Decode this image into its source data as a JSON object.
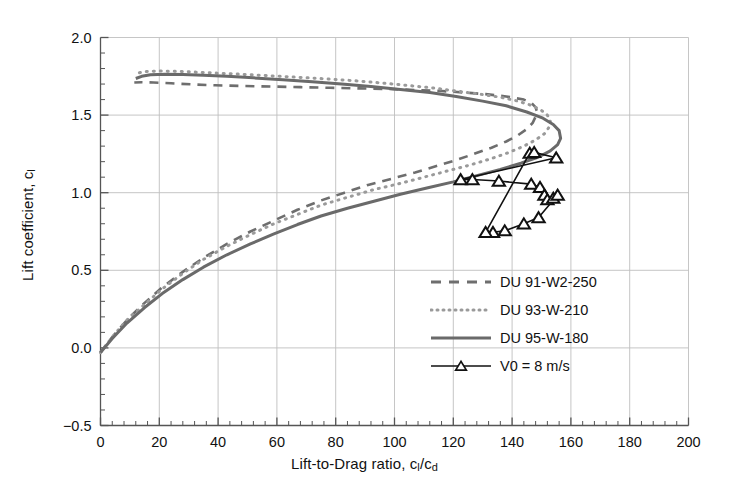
{
  "chart_data": {
    "type": "line",
    "title": "",
    "xlabel": "Lift-to-Drag ratio, c_l/c_d",
    "ylabel": "Lift coefficient, c_l",
    "xlabel_main": "Lift-to-Drag ratio, c",
    "xlabel_sub1": "l",
    "xlabel_mid": "/c",
    "xlabel_sub2": "d",
    "ylabel_main": "Lift coefficient, c",
    "ylabel_sub": "l",
    "xlim": [
      0,
      200
    ],
    "ylim": [
      -0.5,
      2.0
    ],
    "xticks": [
      0,
      20,
      40,
      60,
      80,
      100,
      120,
      140,
      160,
      180,
      200
    ],
    "xtick_labels": [
      "0",
      "20",
      "40",
      "60",
      "80",
      "100",
      "120",
      "140",
      "160",
      "180",
      "200"
    ],
    "yticks": [
      -0.5,
      0.0,
      0.5,
      1.0,
      1.5,
      2.0
    ],
    "ytick_labels": [
      "-0.5",
      "0.0",
      "0.5",
      "1.0",
      "1.5",
      "2.0"
    ],
    "minor_xticks_per_interval": 4,
    "minor_yticks_per_interval": 4,
    "grid": true,
    "grid_color": "#bfbfbf",
    "axis_color": "#555555",
    "legend_position": "lower-right-inside",
    "series": [
      {
        "name": "DU 91-W2-250",
        "style": "dashed",
        "color": "#6e6e6e",
        "width": 2.6,
        "dash": "9,7",
        "marker": "none",
        "points": [
          [
            0.0,
            -0.03
          ],
          [
            4.0,
            0.07
          ],
          [
            9.0,
            0.18
          ],
          [
            15.0,
            0.29
          ],
          [
            21.0,
            0.39
          ],
          [
            28.0,
            0.49
          ],
          [
            35.0,
            0.58
          ],
          [
            43.0,
            0.67
          ],
          [
            51.0,
            0.75
          ],
          [
            59.0,
            0.82
          ],
          [
            67.0,
            0.89
          ],
          [
            75.0,
            0.95
          ],
          [
            83.0,
            1.0
          ],
          [
            91.0,
            1.05
          ],
          [
            99.0,
            1.09
          ],
          [
            107.0,
            1.13
          ],
          [
            114.0,
            1.17
          ],
          [
            121.0,
            1.21
          ],
          [
            127.0,
            1.25
          ],
          [
            133.0,
            1.29
          ],
          [
            138.0,
            1.33
          ],
          [
            142.0,
            1.37
          ],
          [
            145.0,
            1.41
          ],
          [
            147.0,
            1.45
          ],
          [
            148.0,
            1.49
          ],
          [
            148.5,
            1.52
          ],
          [
            148.0,
            1.55
          ],
          [
            146.5,
            1.58
          ],
          [
            144.0,
            1.6
          ],
          [
            138.0,
            1.62
          ],
          [
            131.0,
            1.635
          ],
          [
            124.0,
            1.645
          ],
          [
            116.0,
            1.655
          ],
          [
            107.0,
            1.662
          ],
          [
            98.0,
            1.668
          ],
          [
            88.0,
            1.672
          ],
          [
            78.0,
            1.676
          ],
          [
            68.0,
            1.68
          ],
          [
            58.0,
            1.684
          ],
          [
            48.0,
            1.688
          ],
          [
            39.0,
            1.692
          ],
          [
            31.0,
            1.698
          ],
          [
            24.0,
            1.705
          ],
          [
            18.0,
            1.71
          ],
          [
            14.0,
            1.712
          ],
          [
            11.5,
            1.71
          ]
        ]
      },
      {
        "name": "DU 93-W-210",
        "style": "dotted",
        "color": "#9a9a9a",
        "width": 3.0,
        "dash": "1,6",
        "marker": "none",
        "points": [
          [
            0.0,
            -0.03
          ],
          [
            4.0,
            0.07
          ],
          [
            9.0,
            0.18
          ],
          [
            15.0,
            0.28
          ],
          [
            21.0,
            0.38
          ],
          [
            28.0,
            0.48
          ],
          [
            35.0,
            0.57
          ],
          [
            43.0,
            0.655
          ],
          [
            51.0,
            0.73
          ],
          [
            59.0,
            0.8
          ],
          [
            67.0,
            0.86
          ],
          [
            75.0,
            0.92
          ],
          [
            84.0,
            0.97
          ],
          [
            93.0,
            1.02
          ],
          [
            102.0,
            1.06
          ],
          [
            110.0,
            1.1
          ],
          [
            118.0,
            1.14
          ],
          [
            126.0,
            1.18
          ],
          [
            133.0,
            1.22
          ],
          [
            139.0,
            1.26
          ],
          [
            144.0,
            1.3
          ],
          [
            148.0,
            1.34
          ],
          [
            151.0,
            1.38
          ],
          [
            152.5,
            1.42
          ],
          [
            153.0,
            1.46
          ],
          [
            152.0,
            1.5
          ],
          [
            150.0,
            1.53
          ],
          [
            147.0,
            1.56
          ],
          [
            142.0,
            1.59
          ],
          [
            136.0,
            1.615
          ],
          [
            129.0,
            1.635
          ],
          [
            121.0,
            1.655
          ],
          [
            113.0,
            1.675
          ],
          [
            104.0,
            1.692
          ],
          [
            95.0,
            1.708
          ],
          [
            86.0,
            1.722
          ],
          [
            76.0,
            1.734
          ],
          [
            66.0,
            1.745
          ],
          [
            56.0,
            1.755
          ],
          [
            47.0,
            1.764
          ],
          [
            38.0,
            1.772
          ],
          [
            30.0,
            1.779
          ],
          [
            24.0,
            1.783
          ],
          [
            19.0,
            1.784
          ],
          [
            15.0,
            1.78
          ],
          [
            12.5,
            1.77
          ],
          [
            11.5,
            1.755
          ]
        ]
      },
      {
        "name": "DU 95-W-180",
        "style": "solid",
        "color": "#6a6a6a",
        "width": 3.0,
        "dash": "none",
        "marker": "none",
        "points": [
          [
            0.0,
            -0.03
          ],
          [
            4.0,
            0.06
          ],
          [
            9.0,
            0.16
          ],
          [
            15.0,
            0.26
          ],
          [
            21.0,
            0.35
          ],
          [
            28.0,
            0.44
          ],
          [
            35.0,
            0.52
          ],
          [
            43.0,
            0.6
          ],
          [
            51.0,
            0.67
          ],
          [
            59.0,
            0.735
          ],
          [
            67.0,
            0.795
          ],
          [
            75.0,
            0.85
          ],
          [
            84.0,
            0.9
          ],
          [
            93.0,
            0.945
          ],
          [
            102.0,
            0.99
          ],
          [
            111.0,
            1.03
          ],
          [
            120.0,
            1.07
          ],
          [
            128.0,
            1.11
          ],
          [
            136.0,
            1.15
          ],
          [
            143.0,
            1.19
          ],
          [
            149.0,
            1.23
          ],
          [
            153.0,
            1.27
          ],
          [
            155.5,
            1.31
          ],
          [
            156.5,
            1.35
          ],
          [
            156.0,
            1.4
          ],
          [
            154.0,
            1.44
          ],
          [
            150.5,
            1.48
          ],
          [
            145.0,
            1.52
          ],
          [
            138.0,
            1.56
          ],
          [
            130.0,
            1.59
          ],
          [
            121.0,
            1.62
          ],
          [
            112.0,
            1.645
          ],
          [
            102.0,
            1.665
          ],
          [
            92.0,
            1.685
          ],
          [
            82.0,
            1.7
          ],
          [
            72.0,
            1.715
          ],
          [
            62.0,
            1.728
          ],
          [
            52.0,
            1.74
          ],
          [
            43.0,
            1.75
          ],
          [
            35.0,
            1.757
          ],
          [
            28.0,
            1.762
          ],
          [
            22.0,
            1.764
          ],
          [
            17.0,
            1.76
          ],
          [
            14.0,
            1.75
          ],
          [
            12.0,
            1.736
          ]
        ]
      },
      {
        "name": "V0 = 8 m/s",
        "style": "solid-marker",
        "color": "#111111",
        "width": 1.6,
        "dash": "none",
        "marker": "triangle-up",
        "points": [
          [
            122.5,
            1.085
          ],
          [
            126.5,
            1.085
          ],
          [
            135.5,
            1.075
          ],
          [
            146.5,
            1.055
          ],
          [
            149.5,
            1.035
          ],
          [
            151.0,
            0.985
          ],
          [
            152.0,
            0.955
          ],
          [
            154.0,
            0.965
          ],
          [
            155.5,
            0.985
          ],
          [
            149.0,
            0.84
          ],
          [
            144.0,
            0.8
          ],
          [
            137.5,
            0.755
          ],
          [
            133.5,
            0.745
          ],
          [
            131.0,
            0.745
          ],
          [
            146.0,
            1.255
          ],
          [
            147.5,
            1.26
          ],
          [
            155.0,
            1.225
          ]
        ]
      }
    ],
    "marker_series_note": "closed loop of open triangle markers connected by a thin black line"
  },
  "legend": {
    "entries": [
      {
        "label": "DU 91-W2-250",
        "style": "dashed",
        "color": "#6e6e6e"
      },
      {
        "label": "DU 93-W-210",
        "style": "dotted",
        "color": "#9a9a9a"
      },
      {
        "label": "DU 95-W-180",
        "style": "solid",
        "color": "#6a6a6a"
      },
      {
        "label": "V0 = 8 m/s",
        "style": "solid-marker",
        "color": "#111111"
      }
    ]
  }
}
